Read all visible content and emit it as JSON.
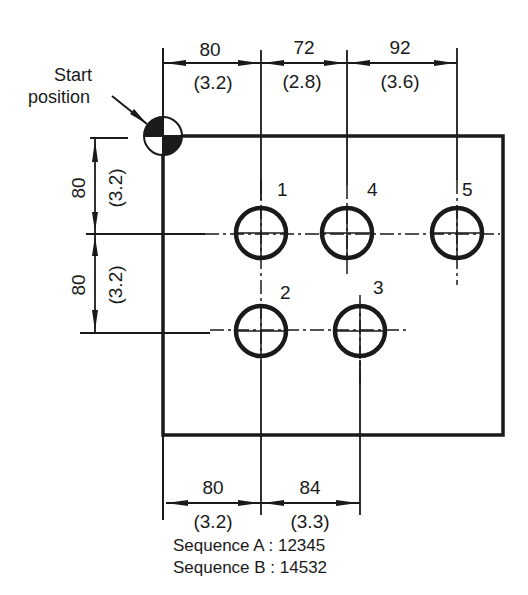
{
  "annotation": {
    "start_label_line1": "Start",
    "start_label_line2": "position"
  },
  "top_dimensions": [
    {
      "mm": "80",
      "in": "(3.2)"
    },
    {
      "mm": "72",
      "in": "(2.8)"
    },
    {
      "mm": "92",
      "in": "(3.6)"
    }
  ],
  "left_dimensions": [
    {
      "mm": "80",
      "in": "(3.2)"
    },
    {
      "mm": "80",
      "in": "(3.2)"
    }
  ],
  "bottom_dimensions": [
    {
      "mm": "80",
      "in": "(3.2)"
    },
    {
      "mm": "84",
      "in": "(3.3)"
    }
  ],
  "holes": [
    {
      "label": "1"
    },
    {
      "label": "4"
    },
    {
      "label": "5"
    },
    {
      "label": "2"
    },
    {
      "label": "3"
    }
  ],
  "sequences": {
    "a": "Sequence A : 12345",
    "b": "Sequence B : 14532"
  },
  "colors": {
    "ink": "#1a1a1a",
    "background": "#ffffff"
  }
}
